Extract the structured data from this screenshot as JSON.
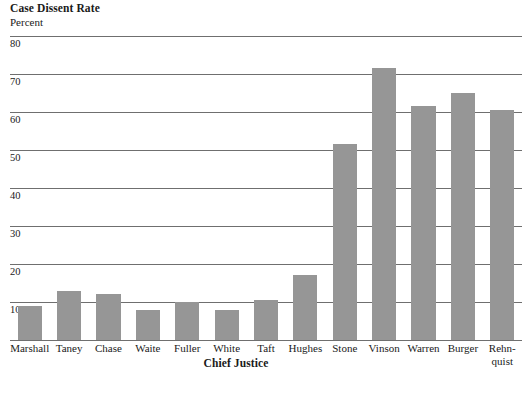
{
  "chart_data": {
    "type": "bar",
    "title": "Case Dissent Rate",
    "subtitle": "Percent",
    "xlabel": "Chief Justice",
    "ylabel": "Percent",
    "ylim": [
      0,
      80
    ],
    "yticks": [
      10,
      20,
      30,
      40,
      50,
      60,
      70,
      80
    ],
    "grid": true,
    "legend": false,
    "bar_color": "#969696",
    "gridline_color": "#6f6f6f",
    "categories": [
      "Marshall",
      "Taney",
      "Chase",
      "Waite",
      "Fuller",
      "White",
      "Taft",
      "Hughes",
      "Stone",
      "Vinson",
      "Warren",
      "Burger",
      "Rehn-\nquist"
    ],
    "values": [
      9,
      13,
      12,
      8,
      10,
      8,
      10.5,
      17,
      51.5,
      71.5,
      61.5,
      65,
      60.5
    ]
  },
  "yticks_text": [
    "80",
    "70",
    "60",
    "50",
    "40",
    "30",
    "20",
    "10"
  ]
}
